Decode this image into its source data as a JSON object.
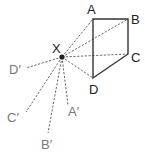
{
  "diagram": {
    "type": "enlargement-construction",
    "center": {
      "label": "X",
      "x": 62,
      "y": 57
    },
    "shape": [
      {
        "label": "A",
        "x": 93,
        "y": 19,
        "lx": 87,
        "ly": 14
      },
      {
        "label": "B",
        "x": 128,
        "y": 19,
        "lx": 131,
        "ly": 24
      },
      {
        "label": "C",
        "x": 128,
        "y": 54,
        "lx": 131,
        "ly": 62
      },
      {
        "label": "D",
        "x": 93,
        "y": 78,
        "lx": 89,
        "ly": 94
      }
    ],
    "image_points": [
      {
        "label": "D′",
        "x": 26,
        "y": 68,
        "lx": 9,
        "ly": 74
      },
      {
        "label": "C′",
        "x": 26,
        "y": 112,
        "lx": 7,
        "ly": 122
      },
      {
        "label": "B′",
        "x": 48,
        "y": 133,
        "lx": 41,
        "ly": 149
      },
      {
        "label": "A′",
        "x": 68,
        "y": 105,
        "lx": 68,
        "ly": 116
      }
    ],
    "center_label": {
      "text": "X",
      "lx": 52,
      "ly": 53
    }
  }
}
